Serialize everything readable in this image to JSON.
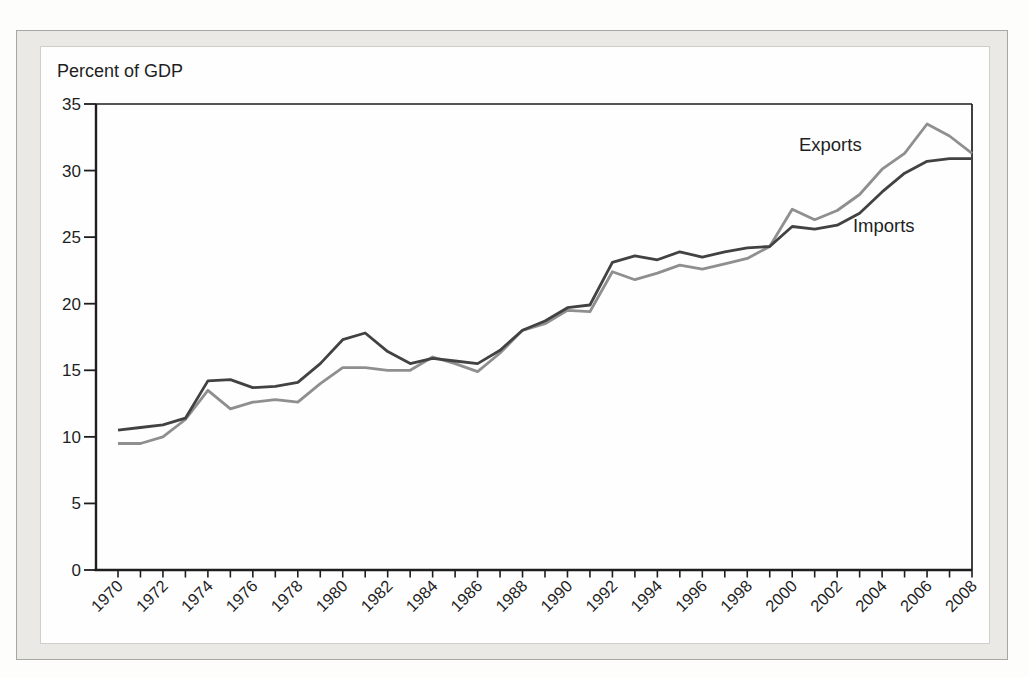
{
  "figure": {
    "kind": "scanned textbook line chart",
    "axis_title": "Percent of GDP"
  },
  "colors": {
    "exports_line": "#8f8f8f",
    "imports_line": "#424242",
    "axis": "#1e1e1e",
    "frame_fill": "#eae9e5",
    "frame_border": "#a7a7a4",
    "panel_fill": "#fefefe",
    "text": "#1f1f1f"
  },
  "chart_data": {
    "type": "line",
    "title": "",
    "ylabel": "Percent of GDP",
    "xlabel": "",
    "ylim": [
      0,
      35
    ],
    "yticks": [
      0,
      5,
      10,
      15,
      20,
      25,
      30,
      35
    ],
    "xlim": [
      1970,
      2008
    ],
    "xtick_every_year": true,
    "xtick_label_interval": 2,
    "xtick_labels": [
      "1970",
      "1972",
      "1974",
      "1976",
      "1978",
      "1980",
      "1982",
      "1984",
      "1986",
      "1988",
      "1990",
      "1992",
      "1994",
      "1996",
      "1998",
      "2000",
      "2002",
      "2004",
      "2006",
      "2008"
    ],
    "grid": false,
    "legend_position": "inline-annotations",
    "x": [
      1970,
      1971,
      1972,
      1973,
      1974,
      1975,
      1976,
      1977,
      1978,
      1979,
      1980,
      1981,
      1982,
      1983,
      1984,
      1985,
      1986,
      1987,
      1988,
      1989,
      1990,
      1991,
      1992,
      1993,
      1994,
      1995,
      1996,
      1997,
      1998,
      1999,
      2000,
      2001,
      2002,
      2003,
      2004,
      2005,
      2006,
      2007,
      2008
    ],
    "series": [
      {
        "name": "Exports",
        "color": "#8f8f8f",
        "values": [
          9.5,
          9.5,
          10.0,
          11.3,
          13.5,
          12.1,
          12.6,
          12.8,
          12.6,
          14.0,
          15.2,
          15.2,
          15.0,
          15.0,
          16.0,
          15.5,
          14.9,
          16.3,
          18.0,
          18.5,
          19.5,
          19.4,
          22.4,
          21.8,
          22.3,
          22.9,
          22.6,
          23.0,
          23.4,
          24.3,
          27.1,
          26.3,
          27.0,
          28.2,
          30.1,
          31.3,
          33.5,
          32.6,
          31.3
        ]
      },
      {
        "name": "Imports",
        "color": "#424242",
        "values": [
          10.5,
          10.7,
          10.9,
          11.4,
          14.2,
          14.3,
          13.7,
          13.8,
          14.1,
          15.5,
          17.3,
          17.8,
          16.4,
          15.5,
          15.9,
          15.7,
          15.5,
          16.5,
          18.0,
          18.7,
          19.7,
          19.9,
          23.1,
          23.6,
          23.3,
          23.9,
          23.5,
          23.9,
          24.2,
          24.3,
          25.8,
          25.6,
          25.9,
          26.8,
          28.4,
          29.8,
          30.7,
          30.9,
          30.9
        ]
      }
    ],
    "annotations": [
      {
        "text": "Exports",
        "x": 2000.3,
        "y": 31.5
      },
      {
        "text": "Imports",
        "x": 2002.7,
        "y": 25.4
      }
    ]
  }
}
